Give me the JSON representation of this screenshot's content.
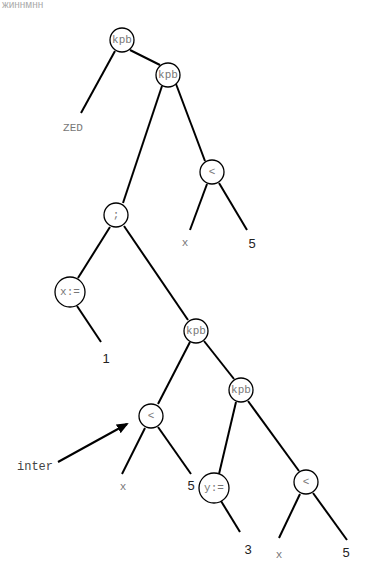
{
  "header_fragment": "жиннмнн",
  "tree": {
    "nodes": [
      {
        "id": "n1",
        "label": "kpb"
      },
      {
        "id": "n2",
        "label": "kpb"
      },
      {
        "id": "n3",
        "label": "<"
      },
      {
        "id": "n4",
        "label": ";"
      },
      {
        "id": "n5",
        "label": "x:="
      },
      {
        "id": "n6",
        "label": "kpb"
      },
      {
        "id": "n7",
        "label": "<"
      },
      {
        "id": "n8",
        "label": "kpb"
      },
      {
        "id": "n9",
        "label": "y:="
      },
      {
        "id": "n10",
        "label": "<"
      }
    ],
    "leaves": [
      {
        "id": "l1",
        "label": "ZED"
      },
      {
        "id": "l2",
        "label": "x"
      },
      {
        "id": "l3",
        "label": "5"
      },
      {
        "id": "l4",
        "label": "1"
      },
      {
        "id": "l5",
        "label": "x"
      },
      {
        "id": "l6",
        "label": "5"
      },
      {
        "id": "l7",
        "label": "3"
      },
      {
        "id": "l8",
        "label": "x"
      },
      {
        "id": "l9",
        "label": "5"
      }
    ]
  },
  "annotation": {
    "label": "inter"
  }
}
